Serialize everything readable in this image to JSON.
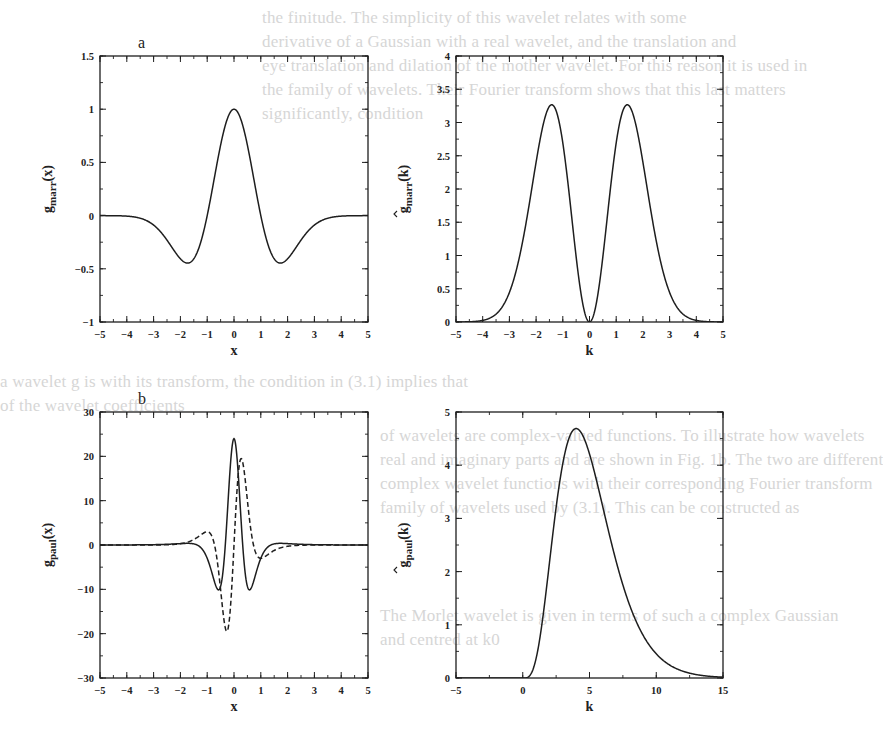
{
  "figure": {
    "background": "#ffffff",
    "ink_color": "#1e1e1e",
    "ghost_text_color": "#d6d6d6",
    "panel_labels": [
      "a",
      "b"
    ]
  },
  "ghost_text": [
    {
      "text": "the finitude. The simplicity of this wavelet relates with some",
      "x": 262,
      "y": 22
    },
    {
      "text": "derivative of a Gaussian with a real wavelet, and the translation and",
      "x": 262,
      "y": 46
    },
    {
      "text": "eye translation and dilation of the mother wavelet. For this reason it is used in",
      "x": 262,
      "y": 70
    },
    {
      "text": "the family of wavelets. Their Fourier transform shows that this last matters",
      "x": 262,
      "y": 94
    },
    {
      "text": "significantly, condition",
      "x": 262,
      "y": 118
    },
    {
      "text": "a wavelet g is with its transform, the condition in (3.1) implies that",
      "x": 0,
      "y": 386
    },
    {
      "text": "of the wavelet coefficients",
      "x": 0,
      "y": 410
    },
    {
      "text": "of wavelets are complex-valued functions. To illustrate how wavelets",
      "x": 380,
      "y": 440
    },
    {
      "text": "real and imaginary parts and are shown in Fig. 1b. The two are different",
      "x": 380,
      "y": 464
    },
    {
      "text": "complex wavelet functions with their corresponding Fourier transform",
      "x": 380,
      "y": 488
    },
    {
      "text": "family of wavelets used by (3.1). This can be constructed as",
      "x": 380,
      "y": 512
    },
    {
      "text": "The Morlet wavelet is given in terms of such a complex Gaussian",
      "x": 380,
      "y": 620
    },
    {
      "text": "and centred at k0",
      "x": 380,
      "y": 644
    }
  ],
  "chart_data": [
    {
      "id": "a-left",
      "type": "line",
      "panel_label": "a",
      "title": "",
      "xlabel": "x",
      "ylabel": "g_marr(x)",
      "ylabel_main": "g",
      "ylabel_sub": "marr",
      "ylabel_arg": "(x)",
      "ylabel_hat": false,
      "xlim": [
        -5,
        5
      ],
      "ylim": [
        -1,
        1.5
      ],
      "xticks": [
        -5,
        -4,
        -3,
        -2,
        -1,
        0,
        1,
        2,
        3,
        4,
        5
      ],
      "xtick_labels": [
        "-5",
        "-4",
        "-3",
        "-2",
        "-1",
        "0",
        "1",
        "2",
        "3",
        "4",
        "5"
      ],
      "yticks": [
        -1,
        -0.5,
        0,
        0.5,
        1,
        1.5
      ],
      "ytick_labels": [
        "-1",
        "-0.5",
        "0",
        "0.5",
        "1",
        "1.5"
      ],
      "x_minor_step": 0.5,
      "y_minor_step": 0.25,
      "grid": false,
      "legend": null,
      "frame": {
        "x": 100,
        "y": 56,
        "w": 268,
        "h": 266
      },
      "series": [
        {
          "name": "Marr wavelet (Mexican hat)",
          "style": "solid",
          "formula": "(1 - x^2) * exp(-x^2 / 2)",
          "points": [
            [
              -5,
              0.0
            ],
            [
              -4,
              -0.005
            ],
            [
              -3,
              -0.089
            ],
            [
              -2,
              -0.406
            ],
            [
              -1.73,
              -0.446
            ],
            [
              -1,
              0.0
            ],
            [
              -0.5,
              0.662
            ],
            [
              0,
              1.0
            ],
            [
              0.5,
              0.662
            ],
            [
              1,
              0.0
            ],
            [
              1.73,
              -0.446
            ],
            [
              2,
              -0.406
            ],
            [
              3,
              -0.089
            ],
            [
              4,
              -0.005
            ],
            [
              5,
              0.0
            ]
          ]
        }
      ]
    },
    {
      "id": "a-right",
      "type": "line",
      "panel_label": "",
      "title": "",
      "xlabel": "k",
      "ylabel": "ĝ_marr(k)",
      "ylabel_main": "g",
      "ylabel_sub": "marr",
      "ylabel_arg": "(k)",
      "ylabel_hat": true,
      "xlim": [
        -5,
        5
      ],
      "ylim": [
        0,
        4
      ],
      "xticks": [
        -5,
        -4,
        -3,
        -2,
        -1,
        0,
        1,
        2,
        3,
        4,
        5
      ],
      "xtick_labels": [
        "-5",
        "-4",
        "-3",
        "-2",
        "-1",
        "0",
        "1",
        "2",
        "3",
        "4",
        "5"
      ],
      "yticks": [
        0,
        0.5,
        1,
        1.5,
        2,
        2.5,
        3,
        3.5,
        4
      ],
      "ytick_labels": [
        "0",
        "0.5",
        "1",
        "1.5",
        "2",
        "2.5",
        "3",
        "3.5",
        "4"
      ],
      "x_minor_step": 0.5,
      "y_minor_step": 0.25,
      "grid": false,
      "legend": null,
      "frame": {
        "x": 456,
        "y": 56,
        "w": 267,
        "h": 266
      },
      "series": [
        {
          "name": "Fourier transform of Marr wavelet",
          "style": "solid",
          "formula": "4.44 * k^2 * exp(-k^2 / 2)",
          "points": [
            [
              -5,
              0.0
            ],
            [
              -4,
              0.024
            ],
            [
              -3,
              0.444
            ],
            [
              -2,
              2.403
            ],
            [
              -1.41,
              3.27
            ],
            [
              -1,
              2.693
            ],
            [
              -0.5,
              0.979
            ],
            [
              0,
              0.0
            ],
            [
              0.5,
              0.979
            ],
            [
              1,
              2.693
            ],
            [
              1.41,
              3.27
            ],
            [
              2,
              2.403
            ],
            [
              3,
              0.444
            ],
            [
              4,
              0.024
            ],
            [
              5,
              0.0
            ]
          ]
        }
      ]
    },
    {
      "id": "b-left",
      "type": "line",
      "panel_label": "b",
      "title": "",
      "xlabel": "x",
      "ylabel": "g_paul(x)",
      "ylabel_main": "g",
      "ylabel_sub": "paul",
      "ylabel_arg": "(x)",
      "ylabel_hat": false,
      "xlim": [
        -5,
        5
      ],
      "ylim": [
        -30,
        30
      ],
      "xticks": [
        -5,
        -4,
        -3,
        -2,
        -1,
        0,
        1,
        2,
        3,
        4,
        5
      ],
      "xtick_labels": [
        "-5",
        "-4",
        "-3",
        "-2",
        "-1",
        "0",
        "1",
        "2",
        "3",
        "4",
        "5"
      ],
      "yticks": [
        -30,
        -20,
        -10,
        0,
        10,
        20,
        30
      ],
      "ytick_labels": [
        "-30",
        "-20",
        "-10",
        "0",
        "10",
        "20",
        "30"
      ],
      "x_minor_step": 0.5,
      "y_minor_step": 5,
      "grid": false,
      "legend": null,
      "frame": {
        "x": 100,
        "y": 412,
        "w": 268,
        "h": 266
      },
      "series": [
        {
          "name": "Paul wavelet real part",
          "style": "solid",
          "formula": "24 * (1 - 10x^2 + 5x^4) / (1 + x^2)^5",
          "points": [
            [
              -5,
              0.0
            ],
            [
              -2,
              0.153
            ],
            [
              -1,
              -3.0
            ],
            [
              -0.57,
              -10.1
            ],
            [
              -0.3,
              5.4
            ],
            [
              0,
              24.0
            ],
            [
              0.3,
              5.4
            ],
            [
              0.57,
              -10.1
            ],
            [
              1,
              -3.0
            ],
            [
              2,
              0.153
            ],
            [
              5,
              0.0
            ]
          ]
        },
        {
          "name": "Paul wavelet imaginary part",
          "style": "dashed",
          "formula": "24 * (5x - 10x^3 + x^5) / (1 + x^2)^5",
          "points": [
            [
              -5,
              0.0
            ],
            [
              -2,
              -0.3
            ],
            [
              -1,
              3.0
            ],
            [
              -0.6,
              -7.5
            ],
            [
              -0.3,
              -19.2
            ],
            [
              0,
              0.0
            ],
            [
              0.3,
              19.2
            ],
            [
              0.6,
              7.5
            ],
            [
              1,
              -3.0
            ],
            [
              2,
              0.3
            ],
            [
              5,
              0.0
            ]
          ]
        }
      ]
    },
    {
      "id": "b-right",
      "type": "line",
      "panel_label": "",
      "title": "",
      "xlabel": "k",
      "ylabel": "ĝ_paul(k)",
      "ylabel_main": "g",
      "ylabel_sub": "paul",
      "ylabel_arg": "(k)",
      "ylabel_hat": true,
      "xlim": [
        -5,
        15
      ],
      "ylim": [
        0,
        5
      ],
      "xticks": [
        -5,
        0,
        5,
        10,
        15
      ],
      "xtick_labels": [
        "-5",
        "0",
        "5",
        "10",
        "15"
      ],
      "yticks": [
        0,
        1,
        2,
        3,
        4,
        5
      ],
      "ytick_labels": [
        "0",
        "1",
        "2",
        "3",
        "4",
        "5"
      ],
      "x_minor_step": 2.5,
      "y_minor_step": 0.5,
      "grid": false,
      "legend": null,
      "frame": {
        "x": 456,
        "y": 412,
        "w": 267,
        "h": 266
      },
      "series": [
        {
          "name": "Fourier transform of Paul wavelet",
          "style": "solid",
          "formula": "k^4 * exp(-k) for k > 0, else 0",
          "points": [
            [
              -5,
              0.0
            ],
            [
              0,
              0.0
            ],
            [
              1,
              0.368
            ],
            [
              2,
              2.165
            ],
            [
              3,
              4.033
            ],
            [
              4,
              4.689
            ],
            [
              5,
              4.211
            ],
            [
              6,
              3.212
            ],
            [
              8,
              1.374
            ],
            [
              10,
              0.454
            ],
            [
              12,
              0.127
            ],
            [
              15,
              0.015
            ]
          ]
        }
      ]
    }
  ]
}
